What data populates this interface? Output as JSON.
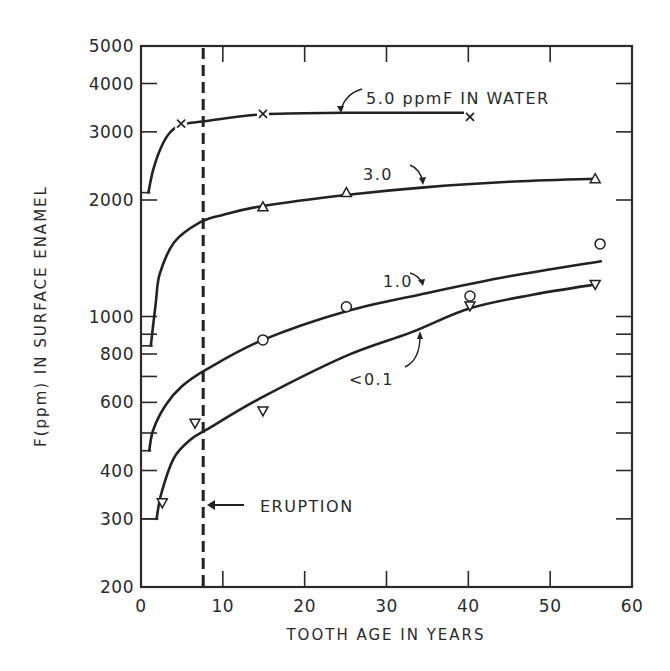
{
  "chart_data": {
    "type": "line",
    "title": "",
    "xlabel": "TOOTH AGE IN YEARS",
    "ylabel": "F(ppm) IN SURFACE ENAMEL",
    "xlim": [
      0,
      60
    ],
    "ylim": [
      200,
      5000
    ],
    "yscale": "log",
    "grid": false,
    "legend": "none (inline annotations)",
    "x_ticks": [
      0,
      10,
      20,
      30,
      40,
      50,
      60
    ],
    "x_tick_labels": [
      "0",
      "10",
      "20",
      "30",
      "40",
      "50",
      "60"
    ],
    "y_ticks_major": [
      200,
      300,
      400,
      600,
      800,
      1000,
      2000,
      3000,
      4000,
      5000
    ],
    "y_tick_labels": [
      "200",
      "300",
      "400",
      "600",
      "800",
      "1000",
      "2000",
      "3000",
      "4000",
      "5000"
    ],
    "y_ticks_minor": [
      500,
      700,
      900
    ],
    "series": [
      {
        "name": "5.0 ppmF IN WATER",
        "label": "5.0 ppmF IN WATER",
        "marker": "x",
        "points": [
          [
            4.9,
            3150
          ],
          [
            14.9,
            3340
          ],
          [
            40.2,
            3280
          ]
        ],
        "curve": [
          [
            0.9,
            2090
          ],
          [
            1.5,
            2400
          ],
          [
            2.5,
            2750
          ],
          [
            3.5,
            2980
          ],
          [
            4.9,
            3130
          ],
          [
            8,
            3200
          ],
          [
            14.9,
            3330
          ],
          [
            25,
            3360
          ],
          [
            40,
            3360
          ]
        ]
      },
      {
        "name": "3.0",
        "label": "3.0",
        "marker": "triangle-up",
        "points": [
          [
            14.9,
            1920
          ],
          [
            25.1,
            2090
          ],
          [
            55.5,
            2270
          ]
        ],
        "curve": [
          [
            1.2,
            840
          ],
          [
            1.8,
            1080
          ],
          [
            2.3,
            1290
          ],
          [
            4.1,
            1560
          ],
          [
            7.2,
            1750
          ],
          [
            10,
            1830
          ],
          [
            14.9,
            1930
          ],
          [
            25,
            2060
          ],
          [
            35,
            2160
          ],
          [
            45,
            2230
          ],
          [
            55.5,
            2270
          ]
        ]
      },
      {
        "name": "1.0",
        "label": "1.0",
        "marker": "circle",
        "points": [
          [
            14.9,
            870
          ],
          [
            25.1,
            1060
          ],
          [
            40.2,
            1130
          ],
          [
            56.1,
            1540
          ]
        ],
        "curve": [
          [
            1.0,
            450
          ],
          [
            1.5,
            510
          ],
          [
            3,
            590
          ],
          [
            5,
            660
          ],
          [
            8,
            730
          ],
          [
            14.9,
            870
          ],
          [
            25,
            1030
          ],
          [
            35,
            1150
          ],
          [
            45,
            1270
          ],
          [
            56.2,
            1390
          ]
        ]
      },
      {
        "name": "<0.1",
        "label": "<0.1",
        "marker": "triangle-down",
        "points": [
          [
            2.6,
            330
          ],
          [
            6.6,
            530
          ],
          [
            14.9,
            570
          ],
          [
            40.2,
            1065
          ],
          [
            55.5,
            1210
          ]
        ],
        "curve": [
          [
            1.9,
            300
          ],
          [
            2.5,
            350
          ],
          [
            4,
            430
          ],
          [
            6,
            480
          ],
          [
            8,
            510
          ],
          [
            14.9,
            620
          ],
          [
            25,
            790
          ],
          [
            33,
            910
          ],
          [
            40.2,
            1050
          ],
          [
            48,
            1140
          ],
          [
            55.5,
            1210
          ]
        ]
      }
    ],
    "annotations": [
      {
        "text": "5.0 ppmF IN WATER",
        "points_to_series": "5.0 ppmF IN WATER"
      },
      {
        "text": "3.0",
        "points_to_series": "3.0"
      },
      {
        "text": "1.0",
        "points_to_series": "1.0"
      },
      {
        "text": "<0.1",
        "points_to_series": "<0.1"
      },
      {
        "text": "ERUPTION",
        "type": "vertical dashed line",
        "x": 7.6
      }
    ],
    "eruption_x": 7.6
  },
  "labels": {
    "xlabel": "TOOTH AGE IN YEARS",
    "ylabel": "F(ppm) IN SURFACE ENAMEL",
    "series_5": "5.0 ppmF IN WATER",
    "series_3": "3.0",
    "series_1": "1.0",
    "series_01": "<0.1",
    "eruption": "ERUPTION"
  }
}
